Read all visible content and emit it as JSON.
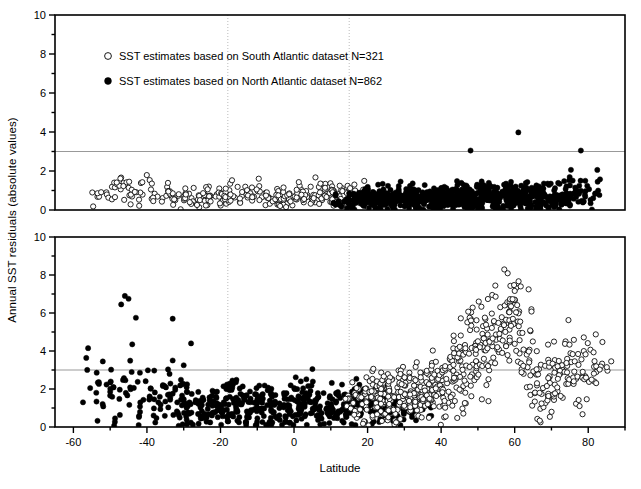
{
  "figure": {
    "axis_label_x": "Latitude",
    "axis_label_y": "Annual SST residuals (absolute values)",
    "background": "#ffffff",
    "axis_color": "#000000",
    "grid_color": "#aaaaaa",
    "marker_fill_open": "#ffffff",
    "marker_fill_closed": "#000000"
  },
  "legend": {
    "entries": [
      {
        "marker": "open-circle",
        "label": "SST estimates based on South Atlantic dataset N=321"
      },
      {
        "marker": "filled-circle",
        "label": "SST estimates based on North Atlantic dataset N=862"
      }
    ]
  },
  "chart_data": {
    "type": "scatter",
    "title": "",
    "xlabel": "Latitude",
    "ylabel": "Annual SST residuals (absolute values)",
    "xlim": [
      -65,
      90
    ],
    "ylim": [
      0,
      10
    ],
    "xticks": [
      -60,
      -40,
      -20,
      0,
      20,
      40,
      60,
      80
    ],
    "xtick_labels": [
      "-60",
      "-40",
      "-20",
      "0",
      "20",
      "40",
      "60",
      "80"
    ],
    "xminor_step": 10,
    "yticks": [
      0,
      2,
      4,
      6,
      8,
      10
    ],
    "ytick_labels": [
      "0",
      "2",
      "4",
      "6",
      "8",
      "10"
    ],
    "yminor_step": 1,
    "grid": false,
    "legend_position": "top-left",
    "reference_lines": {
      "horizontal": [
        {
          "y": 3,
          "color": "#999999",
          "style": "solid"
        }
      ],
      "vertical": [
        {
          "x": -18,
          "color": "#bbbbbb",
          "style": "dotted"
        },
        {
          "x": 15,
          "color": "#bbbbbb",
          "style": "dotted"
        }
      ]
    },
    "panels": [
      {
        "name": "top-panel",
        "ylim": [
          0,
          10
        ],
        "description": "Residuals are small (mostly < 2.5) across all latitudes; South Atlantic open circles dominate latitudes below 15, North Atlantic filled circles dominate above 15.",
        "series": [
          {
            "name": "South Atlantic dataset",
            "marker": "open-circle",
            "n": 321,
            "lat_range": [
              -57,
              20
            ],
            "y_range": [
              0.02,
              2.45
            ],
            "density_profile": [
              {
                "lat": -57,
                "count": 2,
                "y_mean": 1.1,
                "y_spread": 0.4
              },
              {
                "lat": -52,
                "count": 10,
                "y_mean": 0.8,
                "y_spread": 0.55
              },
              {
                "lat": -47,
                "count": 16,
                "y_mean": 1.1,
                "y_spread": 0.7
              },
              {
                "lat": -42,
                "count": 14,
                "y_mean": 1.0,
                "y_spread": 0.65
              },
              {
                "lat": -37,
                "count": 12,
                "y_mean": 0.8,
                "y_spread": 0.5
              },
              {
                "lat": -32,
                "count": 16,
                "y_mean": 0.6,
                "y_spread": 0.45
              },
              {
                "lat": -27,
                "count": 22,
                "y_mean": 0.55,
                "y_spread": 0.4
              },
              {
                "lat": -22,
                "count": 24,
                "y_mean": 0.6,
                "y_spread": 0.4
              },
              {
                "lat": -17,
                "count": 22,
                "y_mean": 0.75,
                "y_spread": 0.5
              },
              {
                "lat": -12,
                "count": 20,
                "y_mean": 0.8,
                "y_spread": 0.5
              },
              {
                "lat": -7,
                "count": 22,
                "y_mean": 0.6,
                "y_spread": 0.4
              },
              {
                "lat": -2,
                "count": 26,
                "y_mean": 0.6,
                "y_spread": 0.42
              },
              {
                "lat": 3,
                "count": 28,
                "y_mean": 0.75,
                "y_spread": 0.45
              },
              {
                "lat": 8,
                "count": 30,
                "y_mean": 0.85,
                "y_spread": 0.5
              },
              {
                "lat": 13,
                "count": 30,
                "y_mean": 0.75,
                "y_spread": 0.45
              },
              {
                "lat": 18,
                "count": 18,
                "y_mean": 0.7,
                "y_spread": 0.45
              }
            ]
          },
          {
            "name": "North Atlantic dataset",
            "marker": "filled-circle",
            "n": 862,
            "lat_range": [
              12,
              84
            ],
            "y_range": [
              0.02,
              4.0
            ],
            "outliers": [
              {
                "lat": 61,
                "y": 3.98
              },
              {
                "lat": 48,
                "y": 3.05
              },
              {
                "lat": 78,
                "y": 3.05
              }
            ],
            "density_profile": [
              {
                "lat": 13,
                "count": 18,
                "y_mean": 0.5,
                "y_spread": 0.35
              },
              {
                "lat": 17,
                "count": 40,
                "y_mean": 0.55,
                "y_spread": 0.4
              },
              {
                "lat": 21,
                "count": 48,
                "y_mean": 0.6,
                "y_spread": 0.45
              },
              {
                "lat": 25,
                "count": 50,
                "y_mean": 0.6,
                "y_spread": 0.45
              },
              {
                "lat": 29,
                "count": 52,
                "y_mean": 0.62,
                "y_spread": 0.48
              },
              {
                "lat": 33,
                "count": 54,
                "y_mean": 0.6,
                "y_spread": 0.45
              },
              {
                "lat": 37,
                "count": 56,
                "y_mean": 0.65,
                "y_spread": 0.5
              },
              {
                "lat": 41,
                "count": 58,
                "y_mean": 0.65,
                "y_spread": 0.5
              },
              {
                "lat": 45,
                "count": 60,
                "y_mean": 0.7,
                "y_spread": 0.55
              },
              {
                "lat": 49,
                "count": 62,
                "y_mean": 0.7,
                "y_spread": 0.55
              },
              {
                "lat": 53,
                "count": 60,
                "y_mean": 0.72,
                "y_spread": 0.55
              },
              {
                "lat": 57,
                "count": 58,
                "y_mean": 0.7,
                "y_spread": 0.55
              },
              {
                "lat": 61,
                "count": 56,
                "y_mean": 0.72,
                "y_spread": 0.58
              },
              {
                "lat": 65,
                "count": 54,
                "y_mean": 0.7,
                "y_spread": 0.55
              },
              {
                "lat": 69,
                "count": 48,
                "y_mean": 0.68,
                "y_spread": 0.55
              },
              {
                "lat": 73,
                "count": 40,
                "y_mean": 0.7,
                "y_spread": 0.55
              },
              {
                "lat": 77,
                "count": 26,
                "y_mean": 0.85,
                "y_spread": 0.7
              },
              {
                "lat": 81,
                "count": 14,
                "y_mean": 1.1,
                "y_spread": 0.8
              }
            ]
          }
        ]
      },
      {
        "name": "bottom-panel",
        "ylim": [
          0,
          10
        ],
        "description": "Residuals are much larger; North Atlantic filled circles scatter up to 7 at southern latitudes, South Atlantic open circles rise steeply to 8.5 near latitude 60 then dip and rise again near 80.",
        "series": [
          {
            "name": "North Atlantic dataset",
            "marker": "filled-circle",
            "n": 862,
            "lat_range": [
              -57,
              38
            ],
            "y_range": [
              0.05,
              7.0
            ],
            "outliers": [
              {
                "lat": -46,
                "y": 6.9
              },
              {
                "lat": -45,
                "y": 6.75
              },
              {
                "lat": -47,
                "y": 6.45
              },
              {
                "lat": -43,
                "y": 5.75
              },
              {
                "lat": -33,
                "y": 5.7
              },
              {
                "lat": -56,
                "y": 4.15
              },
              {
                "lat": -44,
                "y": 4.35
              },
              {
                "lat": -28,
                "y": 4.4
              },
              {
                "lat": -52,
                "y": 3.45
              },
              {
                "lat": -33,
                "y": 3.5
              },
              {
                "lat": -30,
                "y": 3.25
              },
              {
                "lat": 5,
                "y": 3.05
              }
            ],
            "density_profile": [
              {
                "lat": -56,
                "count": 6,
                "y_mean": 1.7,
                "y_spread": 1.3
              },
              {
                "lat": -52,
                "count": 10,
                "y_mean": 1.5,
                "y_spread": 1.1
              },
              {
                "lat": -48,
                "count": 14,
                "y_mean": 1.7,
                "y_spread": 1.6
              },
              {
                "lat": -44,
                "count": 16,
                "y_mean": 1.8,
                "y_spread": 1.7
              },
              {
                "lat": -40,
                "count": 14,
                "y_mean": 1.5,
                "y_spread": 1.2
              },
              {
                "lat": -36,
                "count": 16,
                "y_mean": 1.4,
                "y_spread": 1.1
              },
              {
                "lat": -32,
                "count": 22,
                "y_mean": 1.3,
                "y_spread": 1.1
              },
              {
                "lat": -28,
                "count": 26,
                "y_mean": 1.1,
                "y_spread": 0.9
              },
              {
                "lat": -24,
                "count": 30,
                "y_mean": 1.0,
                "y_spread": 0.8
              },
              {
                "lat": -20,
                "count": 32,
                "y_mean": 1.3,
                "y_spread": 1.0
              },
              {
                "lat": -16,
                "count": 34,
                "y_mean": 1.3,
                "y_spread": 1.0
              },
              {
                "lat": -12,
                "count": 34,
                "y_mean": 1.1,
                "y_spread": 0.85
              },
              {
                "lat": -8,
                "count": 34,
                "y_mean": 1.2,
                "y_spread": 0.9
              },
              {
                "lat": -4,
                "count": 32,
                "y_mean": 1.0,
                "y_spread": 0.8
              },
              {
                "lat": 0,
                "count": 34,
                "y_mean": 1.2,
                "y_spread": 0.95
              },
              {
                "lat": 4,
                "count": 34,
                "y_mean": 1.35,
                "y_spread": 1.0
              },
              {
                "lat": 8,
                "count": 32,
                "y_mean": 1.1,
                "y_spread": 0.85
              },
              {
                "lat": 12,
                "count": 32,
                "y_mean": 1.1,
                "y_spread": 0.85
              },
              {
                "lat": 16,
                "count": 34,
                "y_mean": 1.2,
                "y_spread": 0.9
              },
              {
                "lat": 20,
                "count": 36,
                "y_mean": 1.15,
                "y_spread": 0.85
              },
              {
                "lat": 24,
                "count": 34,
                "y_mean": 1.1,
                "y_spread": 0.8
              },
              {
                "lat": 28,
                "count": 26,
                "y_mean": 1.0,
                "y_spread": 0.7
              },
              {
                "lat": 32,
                "count": 14,
                "y_mean": 0.9,
                "y_spread": 0.6
              },
              {
                "lat": 36,
                "count": 6,
                "y_mean": 0.8,
                "y_spread": 0.5
              }
            ]
          },
          {
            "name": "South Atlantic dataset",
            "marker": "open-circle",
            "n": 321,
            "lat_range": [
              14,
              86
            ],
            "y_range": [
              0.05,
              8.6
            ],
            "density_profile": [
              {
                "lat": 15,
                "count": 10,
                "y_mean": 1.3,
                "y_spread": 0.9
              },
              {
                "lat": 18,
                "count": 22,
                "y_mean": 1.4,
                "y_spread": 1.0
              },
              {
                "lat": 21,
                "count": 30,
                "y_mean": 1.5,
                "y_spread": 1.05
              },
              {
                "lat": 24,
                "count": 34,
                "y_mean": 1.5,
                "y_spread": 1.05
              },
              {
                "lat": 27,
                "count": 36,
                "y_mean": 1.6,
                "y_spread": 1.1
              },
              {
                "lat": 30,
                "count": 38,
                "y_mean": 1.7,
                "y_spread": 1.15
              },
              {
                "lat": 33,
                "count": 38,
                "y_mean": 1.8,
                "y_spread": 1.2
              },
              {
                "lat": 36,
                "count": 38,
                "y_mean": 1.9,
                "y_spread": 1.25
              },
              {
                "lat": 39,
                "count": 36,
                "y_mean": 2.2,
                "y_spread": 1.4
              },
              {
                "lat": 42,
                "count": 36,
                "y_mean": 2.6,
                "y_spread": 1.6
              },
              {
                "lat": 45,
                "count": 34,
                "y_mean": 3.3,
                "y_spread": 1.8
              },
              {
                "lat": 48,
                "count": 34,
                "y_mean": 4.0,
                "y_spread": 1.9
              },
              {
                "lat": 51,
                "count": 30,
                "y_mean": 4.3,
                "y_spread": 2.0
              },
              {
                "lat": 54,
                "count": 28,
                "y_mean": 4.4,
                "y_spread": 2.1
              },
              {
                "lat": 57,
                "count": 30,
                "y_mean": 5.4,
                "y_spread": 2.2
              },
              {
                "lat": 60,
                "count": 32,
                "y_mean": 6.0,
                "y_spread": 2.2
              },
              {
                "lat": 63,
                "count": 24,
                "y_mean": 4.4,
                "y_spread": 2.3
              },
              {
                "lat": 66,
                "count": 22,
                "y_mean": 2.3,
                "y_spread": 1.5
              },
              {
                "lat": 69,
                "count": 24,
                "y_mean": 2.0,
                "y_spread": 1.4
              },
              {
                "lat": 72,
                "count": 24,
                "y_mean": 2.6,
                "y_spread": 1.5
              },
              {
                "lat": 75,
                "count": 22,
                "y_mean": 3.1,
                "y_spread": 1.3
              },
              {
                "lat": 78,
                "count": 18,
                "y_mean": 2.6,
                "y_spread": 1.4
              },
              {
                "lat": 81,
                "count": 14,
                "y_mean": 3.4,
                "y_spread": 1.1
              },
              {
                "lat": 84,
                "count": 8,
                "y_mean": 3.6,
                "y_spread": 0.9
              }
            ]
          }
        ]
      }
    ]
  }
}
